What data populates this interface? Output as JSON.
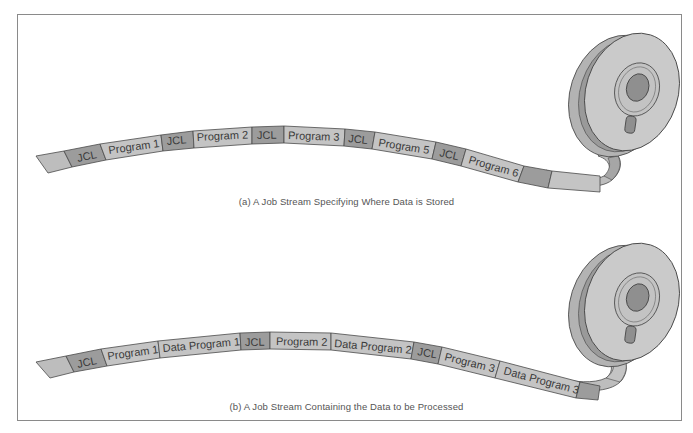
{
  "figure": {
    "colors": {
      "jcl_segment": "#9c9c9c",
      "program_segment": "#c4c4c4",
      "blank_segment": "#bdbdbd",
      "dark_leader": "#a6a6a6",
      "outline": "#4a4a4a",
      "reel_face": "#c9c9c9",
      "reel_rim": "#b3b3b3",
      "reel_hub": "#8f8f8f",
      "frame": "#8a8a8a"
    },
    "panel_a": {
      "caption": "(a) A Job Stream Specifying Where Data is Stored",
      "segments": [
        {
          "label": "",
          "kind": "blank"
        },
        {
          "label": "JCL",
          "kind": "jcl"
        },
        {
          "label": "Program 1",
          "kind": "program"
        },
        {
          "label": "JCL",
          "kind": "jcl"
        },
        {
          "label": "Program 2",
          "kind": "program"
        },
        {
          "label": "JCL",
          "kind": "jcl"
        },
        {
          "label": "Program 3",
          "kind": "program"
        },
        {
          "label": "JCL",
          "kind": "jcl"
        },
        {
          "label": "Program 5",
          "kind": "program"
        },
        {
          "label": "JCL",
          "kind": "jcl"
        },
        {
          "label": "Program 6",
          "kind": "program"
        },
        {
          "label": "",
          "kind": "jcl"
        },
        {
          "label": "",
          "kind": "blank"
        }
      ]
    },
    "panel_b": {
      "caption": "(b) A Job Stream Containing the Data to be Processed",
      "segments": [
        {
          "label": "",
          "kind": "blank"
        },
        {
          "label": "JCL",
          "kind": "jcl"
        },
        {
          "label": "Program 1",
          "kind": "program"
        },
        {
          "label": "Data Program 1",
          "kind": "program"
        },
        {
          "label": "JCL",
          "kind": "jcl"
        },
        {
          "label": "Program 2",
          "kind": "program"
        },
        {
          "label": "Data Program 2",
          "kind": "program"
        },
        {
          "label": "JCL",
          "kind": "jcl"
        },
        {
          "label": "Program 3",
          "kind": "program"
        },
        {
          "label": "Data Program 3",
          "kind": "program"
        },
        {
          "label": "",
          "kind": "jcl"
        },
        {
          "label": "",
          "kind": "blank"
        }
      ]
    }
  }
}
